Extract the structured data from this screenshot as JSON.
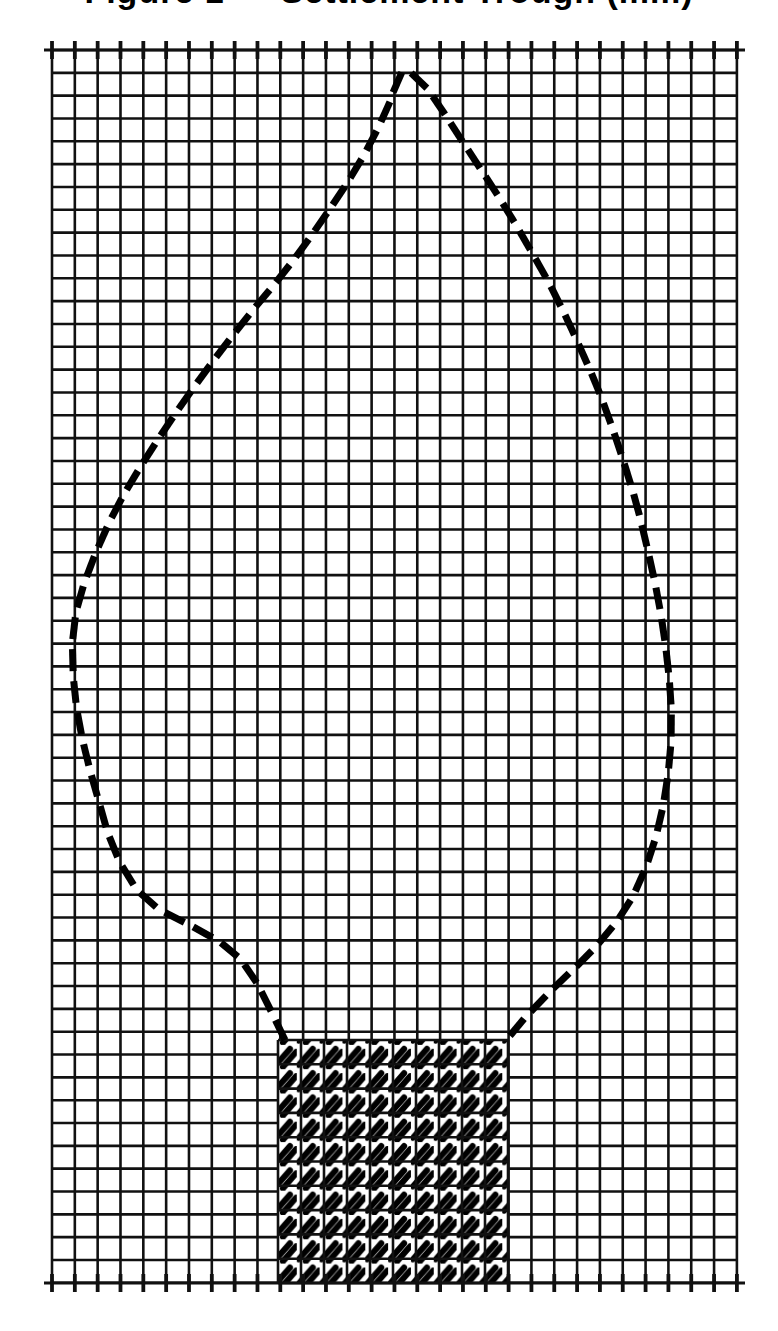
{
  "page": {
    "width": 778,
    "height": 1331,
    "background": "#ffffff",
    "ink_color": "#000000"
  },
  "title": {
    "text": "Figure 1 — Settlement Trough (mm)",
    "clipped": true,
    "note": "Only the bottom edge of the title glyphs is visible at the top of the screenshot."
  },
  "chart_data": {
    "type": "scatter",
    "title": "Figure 1 — Settlement Trough (mm)",
    "subtitle": "",
    "xlabel": "",
    "ylabel": "",
    "grid": true,
    "grid_style": "square engineering grid, uniform line weight",
    "legend": "none",
    "axis_ranges": {
      "x": [
        0,
        30
      ],
      "y": [
        0,
        54
      ]
    },
    "tick_labels": {
      "x": [],
      "y": []
    },
    "grid_geometry": {
      "origin_x_px": 52,
      "origin_y_px": 50,
      "cell_px": 22.83,
      "cols": 30,
      "rows": 54,
      "right_px": 737,
      "bottom_px": 1283,
      "line_width_px": 2.6,
      "line_color": "#111111"
    },
    "series": [
      {
        "name": "dashed-boundary-curve",
        "style": "dashed",
        "dash_glyph": "short diagonal slash",
        "dash_length_px": 22,
        "dash_gap_px": 10,
        "stroke_width_px": 7,
        "closed": false,
        "description": "Teardrop / oval influence boundary rising from lower-left, apex at top-centre, descending down the right side to the hatched block.",
        "points": [
          [
            285,
            1040
          ],
          [
            268,
            1005
          ],
          [
            252,
            975
          ],
          [
            232,
            951
          ],
          [
            208,
            935
          ],
          [
            182,
            921
          ],
          [
            156,
            907
          ],
          [
            136,
            888
          ],
          [
            120,
            862
          ],
          [
            108,
            833
          ],
          [
            99,
            802
          ],
          [
            90,
            770
          ],
          [
            82,
            737
          ],
          [
            76,
            703
          ],
          [
            73,
            669
          ],
          [
            73,
            636
          ],
          [
            78,
            604
          ],
          [
            88,
            573
          ],
          [
            100,
            543
          ],
          [
            114,
            513
          ],
          [
            130,
            484
          ],
          [
            148,
            455
          ],
          [
            167,
            426
          ],
          [
            187,
            397
          ],
          [
            208,
            368
          ],
          [
            230,
            339
          ],
          [
            253,
            310
          ],
          [
            277,
            281
          ],
          [
            301,
            250
          ],
          [
            325,
            216
          ],
          [
            349,
            180
          ],
          [
            371,
            142
          ],
          [
            389,
            104
          ],
          [
            401,
            73
          ],
          [
            418,
            78
          ],
          [
            438,
            104
          ],
          [
            457,
            133
          ],
          [
            476,
            162
          ],
          [
            495,
            191
          ],
          [
            513,
            220
          ],
          [
            531,
            251
          ],
          [
            549,
            283
          ],
          [
            566,
            317
          ],
          [
            582,
            352
          ],
          [
            598,
            389
          ],
          [
            612,
            427
          ],
          [
            625,
            466
          ],
          [
            637,
            506
          ],
          [
            647,
            547
          ],
          [
            656,
            588
          ],
          [
            663,
            628
          ],
          [
            668,
            667
          ],
          [
            671,
            704
          ],
          [
            671,
            740
          ],
          [
            668,
            774
          ],
          [
            663,
            806
          ],
          [
            656,
            836
          ],
          [
            647,
            864
          ],
          [
            636,
            890
          ],
          [
            622,
            914
          ],
          [
            605,
            936
          ],
          [
            585,
            958
          ],
          [
            562,
            980
          ],
          [
            538,
            1004
          ],
          [
            514,
            1030
          ],
          [
            508,
            1040
          ]
        ]
      }
    ],
    "regions": [
      {
        "name": "hatched-block",
        "fill": "cross-hatch / double diagonal tick fill",
        "stroke": "#000000",
        "x_px": 278,
        "y_px": 1040,
        "width_px": 230,
        "height_px": 243,
        "grid_cols": 10,
        "grid_rows": 10,
        "description": "Cross-hatched rectangular block (tunnel / foundation) at bottom centre, seated on the base line of the grid."
      }
    ],
    "annotations": []
  },
  "elements": {
    "grid_label": "engineering grid",
    "curve_label": "dashed boundary curve",
    "block_label": "hatched block"
  }
}
